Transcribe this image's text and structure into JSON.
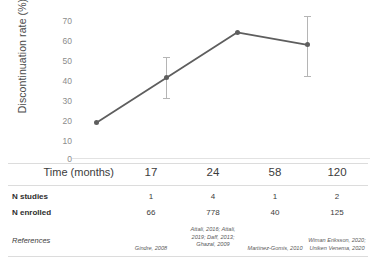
{
  "chart_data": {
    "type": "line",
    "title": "",
    "xlabel": "Time (months)",
    "ylabel": "Discontinuation rate (%)",
    "x": [
      17,
      24,
      58,
      120
    ],
    "categories": [
      "17",
      "24",
      "58",
      "120"
    ],
    "values": [
      18,
      40,
      62,
      56
    ],
    "error_low": [
      null,
      30,
      null,
      41
    ],
    "error_high": [
      null,
      50,
      null,
      70
    ],
    "yticks": [
      70,
      60,
      50,
      40,
      30,
      20,
      10,
      0
    ],
    "ylim": [
      0,
      70
    ],
    "grid": false,
    "legend": "none",
    "series": [
      {
        "name": "Discontinuation rate",
        "values": [
          18,
          40,
          62,
          56
        ],
        "color": "#5e5e5e"
      }
    ],
    "marker_color": "#5e5e5e",
    "line_color": "#5e5e5e",
    "errorbar_color": "#b5b5b5"
  },
  "axis": {
    "y_title": "Discontinuation rate (%)",
    "ticks": [
      "70",
      "60",
      "50",
      "40",
      "30",
      "20",
      "10",
      "0"
    ]
  },
  "table": {
    "rows": [
      {
        "label": "Time (months)",
        "cells": [
          "17",
          "24",
          "58",
          "120"
        ]
      },
      {
        "label": "N studies",
        "cells": [
          "1",
          "4",
          "1",
          "2"
        ]
      },
      {
        "label": "N enrolled",
        "cells": [
          "66",
          "778",
          "40",
          "125"
        ]
      },
      {
        "label": "References",
        "cells": [
          "Gindre, 2008",
          "Attali, 2016; Attali, 2019; Daff, 2013; Ghazal, 2009",
          "Martinez-Gomis, 2010",
          "Wiman Eriksson, 2020; Uniken Venema, 2020"
        ]
      }
    ]
  }
}
